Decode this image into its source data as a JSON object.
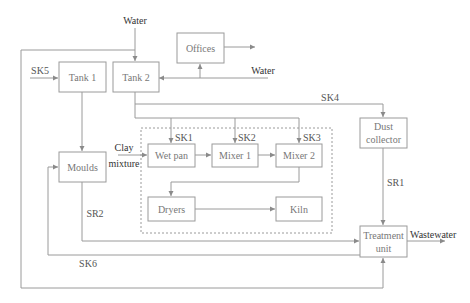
{
  "diagram": {
    "nodes": {
      "offices": "Offices",
      "tank1": "Tank 1",
      "tank2": "Tank 2",
      "dust_collector_line1": "Dust",
      "dust_collector_line2": "collector",
      "moulds": "Moulds",
      "wet_pan": "Wet pan",
      "mixer1": "Mixer 1",
      "mixer2": "Mixer 2",
      "dryers": "Dryers",
      "kiln": "Kiln",
      "treatment_line1": "Treatment",
      "treatment_line2": "unit"
    },
    "labels": {
      "water_top": "Water",
      "water_right": "Water",
      "sk1": "SK1",
      "sk2": "SK2",
      "sk3": "SK3",
      "sk4": "SK4",
      "sk5": "SK5",
      "sk6": "SK6",
      "sr1": "SR1",
      "sr2": "SR2",
      "clay": "Clay",
      "mixture": "mixture",
      "wastewater": "Wastewater"
    },
    "edges": [
      {
        "from": "Water",
        "to": "Tank 2"
      },
      {
        "from": "Water",
        "to": "Tank 2",
        "via": "Offices branch"
      },
      {
        "from": "Water line",
        "to": "Offices"
      },
      {
        "from": "Offices",
        "to": "outflow"
      },
      {
        "from": "SK5",
        "to": "Tank 1"
      },
      {
        "from": "Tank 1",
        "to": "Moulds"
      },
      {
        "from": "Tank 2",
        "to": "Wet pan",
        "label": "SK1"
      },
      {
        "from": "Tank 2",
        "to": "Mixer 1",
        "label": "SK2"
      },
      {
        "from": "Tank 2",
        "to": "Mixer 2",
        "label": "SK3"
      },
      {
        "from": "Tank 2",
        "to": "Dust collector",
        "label": "SK4"
      },
      {
        "from": "Clay mixture",
        "to": "Wet pan"
      },
      {
        "from": "Wet pan",
        "to": "Mixer 1"
      },
      {
        "from": "Mixer 1",
        "to": "Mixer 2"
      },
      {
        "from": "Mixer 2",
        "to": "Dryers"
      },
      {
        "from": "Dryers",
        "to": "Kiln"
      },
      {
        "from": "Dust collector",
        "to": "Treatment unit",
        "label": "SR1"
      },
      {
        "from": "Moulds",
        "to": "Treatment unit",
        "label": "SR2"
      },
      {
        "from": "Treatment unit",
        "to": "Moulds",
        "label": "SK6"
      },
      {
        "from": "Water",
        "to": "Treatment unit",
        "via": "outer loop"
      },
      {
        "from": "Treatment unit",
        "to": "Wastewater"
      }
    ]
  }
}
